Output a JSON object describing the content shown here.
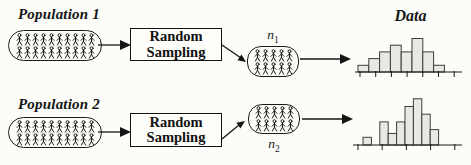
{
  "heading": {
    "data_label": "Data"
  },
  "rows": [
    {
      "population_label": "Population 1",
      "box_label_line1": "Random",
      "box_label_line2": "Sampling",
      "sample_label": "n",
      "sample_sub": "1",
      "population_icons": {
        "rows": 2,
        "cols": 10
      },
      "sample_icons": {
        "rows": 2,
        "cols": 5
      }
    },
    {
      "population_label": "Population 2",
      "box_label_line1": "Random",
      "box_label_line2": "Sampling",
      "sample_label": "n",
      "sample_sub": "2",
      "population_icons": {
        "rows": 2,
        "cols": 10
      },
      "sample_icons": {
        "rows": 2,
        "cols": 5
      }
    }
  ],
  "icons": {
    "person": "stick-figure-person",
    "arrow": "solid-right-arrowhead"
  },
  "colors": {
    "bar_fill": "#e9e9e4",
    "bar_stroke": "#3c3c3c",
    "line": "#1a1a1a",
    "text": "#111111",
    "background": "#fcfcf9"
  },
  "chart_data": [
    {
      "type": "bar",
      "title": "Data (sample 1 histogram)",
      "categories": [],
      "values": [
        1,
        2,
        3,
        4,
        3,
        5,
        3,
        1
      ],
      "xlabel": "",
      "ylabel": "",
      "ylim": [
        0,
        5
      ],
      "grid": false,
      "legend": "none",
      "axis_tick_labels_shown": false
    },
    {
      "type": "bar",
      "title": "Data (sample 2 histogram)",
      "categories": [],
      "values": [
        1,
        0,
        3,
        1.5,
        3,
        5,
        6,
        4,
        2
      ],
      "xlabel": "",
      "ylabel": "",
      "ylim": [
        0,
        6
      ],
      "grid": false,
      "legend": "none",
      "axis_tick_labels_shown": false
    }
  ]
}
